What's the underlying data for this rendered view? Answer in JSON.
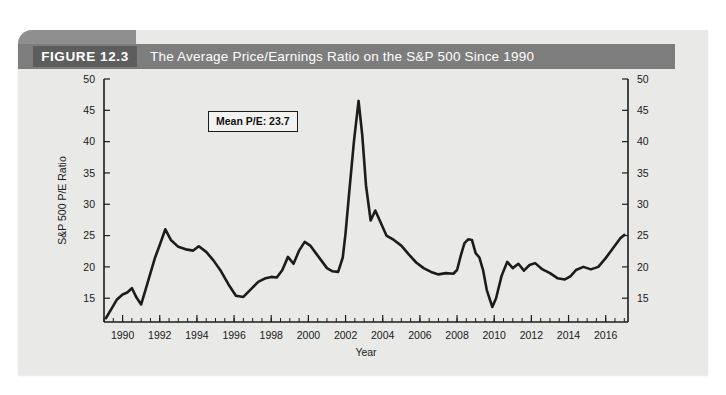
{
  "figure": {
    "number_label": "FIGURE 12.3",
    "title": "The Average Price/Earnings Ratio on the S&P 500 Since 1990",
    "header_bg": "#7d7d7d",
    "number_bg": "#5d5d5d",
    "panel_bg": "#e9e9e7"
  },
  "annotation": {
    "mean_pe_label": "Mean P/E: 23.7"
  },
  "chart_data": {
    "type": "line",
    "title": "The Average Price/Earnings Ratio on the S&P 500 Since 1990",
    "xlabel": "Year",
    "ylabel": "S&P 500 P/E Ratio",
    "xlim": [
      1989,
      2017.2
    ],
    "ylim": [
      11.2,
      50
    ],
    "grid": false,
    "legend": null,
    "line_color": "#1c1c1c",
    "y_ticks": [
      15,
      20,
      25,
      30,
      35,
      40,
      45,
      50
    ],
    "y_tick_labels": [
      "15",
      "20",
      "25",
      "30",
      "35",
      "40",
      "45",
      "50"
    ],
    "right_axis_mirrored": true,
    "x_ticks": [
      1990,
      1992,
      1994,
      1996,
      1998,
      2000,
      2002,
      2004,
      2006,
      2008,
      2010,
      2012,
      2014,
      2016
    ],
    "x_tick_labels": [
      "1990",
      "1992",
      "1994",
      "1996",
      "1998",
      "2000",
      "2002",
      "2004",
      "2006",
      "2008",
      "2010",
      "2012",
      "2014",
      "2016"
    ],
    "x_minor_tick_step": 0.5,
    "annotations": [
      {
        "text": "Mean P/E: 23.7",
        "x": 1992.6,
        "y": 47.0
      }
    ],
    "series": [
      {
        "name": "S&P 500 P/E Ratio",
        "x": [
          1989.1,
          1989.4,
          1989.7,
          1990.0,
          1990.25,
          1990.5,
          1990.75,
          1991.0,
          1991.25,
          1991.5,
          1991.75,
          1992.0,
          1992.3,
          1992.6,
          1993.0,
          1993.4,
          1993.8,
          1994.1,
          1994.5,
          1994.9,
          1995.3,
          1995.7,
          1996.1,
          1996.5,
          1996.9,
          1997.3,
          1997.7,
          1998.0,
          1998.3,
          1998.6,
          1998.9,
          1999.2,
          1999.5,
          1999.8,
          2000.1,
          2000.4,
          2000.7,
          2001.0,
          2001.3,
          2001.6,
          2001.85,
          2002.0,
          2002.2,
          2002.45,
          2002.7,
          2002.9,
          2003.1,
          2003.35,
          2003.6,
          2003.9,
          2004.2,
          2004.6,
          2005.0,
          2005.4,
          2005.8,
          2006.2,
          2006.6,
          2007.0,
          2007.4,
          2007.8,
          2008.0,
          2008.2,
          2008.4,
          2008.6,
          2008.8,
          2009.0,
          2009.2,
          2009.4,
          2009.6,
          2009.9,
          2010.1,
          2010.4,
          2010.7,
          2011.0,
          2011.3,
          2011.6,
          2011.9,
          2012.2,
          2012.6,
          2013.0,
          2013.4,
          2013.8,
          2014.1,
          2014.4,
          2014.8,
          2015.2,
          2015.6,
          2016.0,
          2016.4,
          2016.8,
          2017.0
        ],
        "y": [
          11.8,
          13.3,
          14.8,
          15.6,
          15.9,
          16.6,
          15.1,
          14.0,
          16.5,
          19.0,
          21.5,
          23.5,
          26.0,
          24.3,
          23.2,
          22.8,
          22.6,
          23.3,
          22.4,
          21.0,
          19.3,
          17.2,
          15.4,
          15.2,
          16.4,
          17.6,
          18.2,
          18.4,
          18.3,
          19.5,
          21.6,
          20.5,
          22.6,
          24.0,
          23.4,
          22.2,
          21.0,
          19.8,
          19.3,
          19.2,
          21.5,
          25.4,
          32.0,
          40.0,
          46.5,
          41.0,
          33.0,
          27.4,
          29.0,
          27.0,
          25.0,
          24.3,
          23.4,
          22.0,
          20.7,
          19.8,
          19.2,
          18.8,
          19.0,
          18.9,
          19.5,
          21.8,
          23.8,
          24.4,
          24.3,
          22.2,
          21.5,
          19.5,
          16.3,
          13.6,
          15.0,
          18.6,
          20.8,
          19.8,
          20.5,
          19.4,
          20.3,
          20.6,
          19.6,
          19.0,
          18.2,
          18.0,
          18.5,
          19.5,
          20.0,
          19.6,
          20.0,
          21.4,
          23.0,
          24.6,
          25.1
        ]
      }
    ]
  }
}
